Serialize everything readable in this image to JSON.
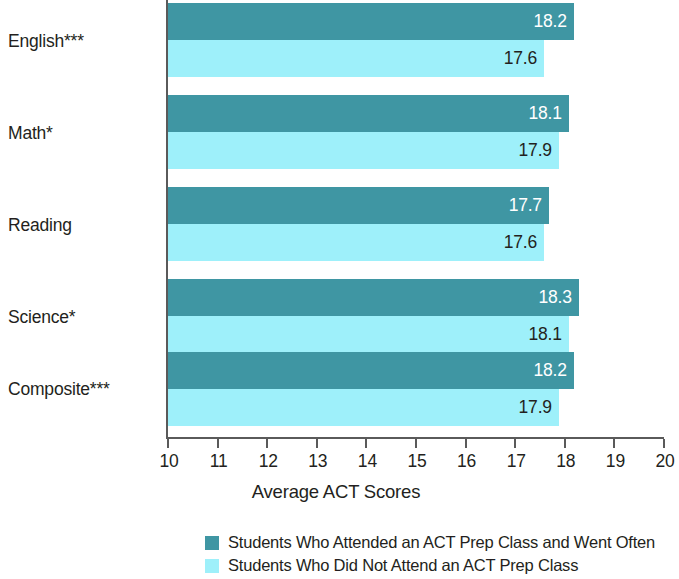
{
  "chart_data": {
    "type": "bar",
    "orientation": "horizontal",
    "title": "",
    "xlabel": "Average ACT Scores",
    "ylabel": "",
    "xlim": [
      10,
      20
    ],
    "xticks": [
      10,
      11,
      12,
      13,
      14,
      15,
      16,
      17,
      18,
      19,
      20
    ],
    "grid": false,
    "legend_position": "bottom",
    "categories": [
      "English***",
      "Math*",
      "Reading",
      "Science*",
      "Composite***"
    ],
    "series": [
      {
        "name": "Students Who Attended an ACT Prep Class and Went Often",
        "color": "#3f96a3",
        "values": [
          18.2,
          18.1,
          17.7,
          18.3,
          18.2
        ],
        "labels": [
          "18.2",
          "18.1",
          "17.7",
          "18.3",
          "18.2"
        ]
      },
      {
        "name": "Students Who Did Not Attend an ACT Prep Class",
        "color": "#9ef0fa",
        "values": [
          17.6,
          17.9,
          17.6,
          18.1,
          17.9
        ],
        "labels": [
          "17.6",
          "17.9",
          "17.6",
          "18.1",
          "17.9"
        ]
      }
    ]
  },
  "axis": {
    "x_title": "Average ACT Scores",
    "tick_labels": [
      "10",
      "11",
      "12",
      "13",
      "14",
      "15",
      "16",
      "17",
      "18",
      "19",
      "20"
    ]
  },
  "legend": {
    "items": [
      {
        "label": "Students Who Attended an ACT Prep Class and Went Often",
        "color": "#3f96a3"
      },
      {
        "label": "Students Who Did Not Attend an ACT Prep Class",
        "color": "#9ef0fa"
      }
    ]
  }
}
